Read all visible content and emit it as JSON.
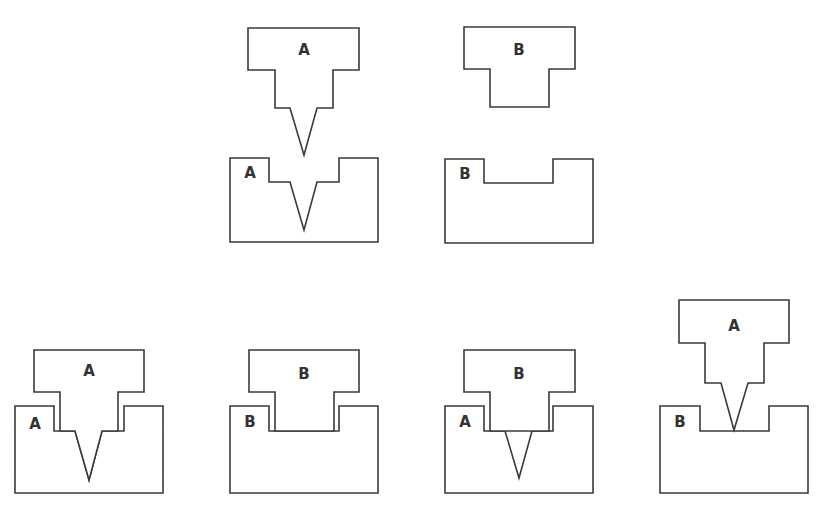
{
  "diagram": {
    "colors": {
      "stroke": "#3a3a3a",
      "fill": "#ffffff",
      "label": "#333333"
    },
    "top_row": [
      {
        "id": "punch-a",
        "kind": "punch",
        "label": "A",
        "label_pos": [
          304,
          50
        ],
        "points": "248,28 359,28 359,70 333,70 333,108 317,108 304,155 290,108 275,108 275,70 248,70"
      },
      {
        "id": "die-a",
        "kind": "die",
        "label": "A",
        "label_pos": [
          250,
          173
        ],
        "points": "230,158 269,158 269,182 290,182 304,230 317,182 339,182 339,158 378,158 378,242 230,242"
      },
      {
        "id": "punch-b",
        "kind": "punch",
        "label": "B",
        "label_pos": [
          519,
          50
        ],
        "points": "464,27 575,27 575,69 549,69 549,107 490,107 490,69 464,69"
      },
      {
        "id": "die-b",
        "kind": "die",
        "label": "B",
        "label_pos": [
          465,
          174
        ],
        "points": "445,159 484,159 484,183 553,183 553,159 593,159 593,243 445,243"
      }
    ],
    "bottom_row": [
      {
        "id": "combo-a-in-a",
        "punch": {
          "label": "A",
          "label_pos": [
            89,
            371
          ],
          "points": "34,350 144,350 144,392 118,392 118,431 102,431 89,480 75,431 60,431 60,392 34,392"
        },
        "die": {
          "label": "A",
          "label_pos": [
            35,
            424
          ],
          "points": "15,406 54,406 54,431 75,431 89,480 102,431 124,431 124,406 163,406 163,493 15,493"
        }
      },
      {
        "id": "combo-b-in-b",
        "punch": {
          "label": "B",
          "label_pos": [
            304,
            374
          ],
          "points": "249,350 359,350 359,392 334,392 334,431 275,431 275,392 249,392"
        },
        "die": {
          "label": "B",
          "label_pos": [
            250,
            422
          ],
          "points": "230,406 269,406 269,431 339,431 339,406 378,406 378,493 230,493"
        }
      },
      {
        "id": "combo-b-in-a",
        "punch": {
          "label": "B",
          "label_pos": [
            519,
            374
          ],
          "points": "464,350 575,350 575,392 549,392 549,431 490,431 490,392 464,392"
        },
        "die": {
          "label": "A",
          "label_pos": [
            465,
            422
          ],
          "points": "445,406 484,406 484,431 505,431 519,478 532,431 553,431 553,406 593,406 593,493 445,493"
        }
      },
      {
        "id": "combo-a-on-b",
        "punch": {
          "label": "A",
          "label_pos": [
            734,
            326
          ],
          "points": "679,300 789,300 789,343 764,343 764,383 748,383 734,430 721,383 705,383 705,343 679,343"
        },
        "die": {
          "label": "B",
          "label_pos": [
            680,
            422
          ],
          "points": "660,406 700,406 700,431 769,431 769,406 808,406 808,493 660,493"
        }
      }
    ]
  }
}
